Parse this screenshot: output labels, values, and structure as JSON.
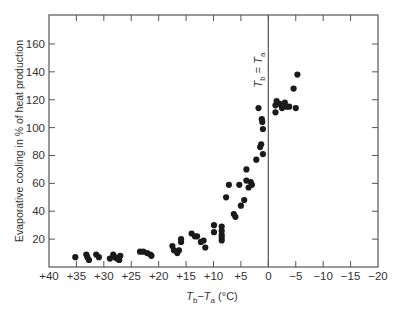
{
  "chart_data": {
    "type": "scatter",
    "title": "",
    "xlabel": "T_b − T_a (°C)",
    "xlabel_parts": {
      "t1": "T",
      "s1": "b",
      "minus": "−",
      "t2": "T",
      "s2": "a",
      "unit": " (°C)"
    },
    "ylabel": "Evaporative cooling in % of heat production",
    "xlim": [
      40,
      -20
    ],
    "ylim": [
      0,
      180
    ],
    "x_reversed": true,
    "x_ticks": [
      40,
      35,
      30,
      25,
      20,
      15,
      10,
      5,
      0,
      -5,
      -10,
      -15,
      -20
    ],
    "x_tick_labels": [
      "+40",
      "+35",
      "+30",
      "+25",
      "+20",
      "+15",
      "+10",
      "+5",
      "0",
      "−5",
      "−10",
      "−15",
      "−20"
    ],
    "y_ticks": [
      20,
      40,
      60,
      80,
      100,
      120,
      140,
      160
    ],
    "y_tick_labels": [
      "20",
      "40",
      "60",
      "80",
      "100",
      "120",
      "140",
      "160"
    ],
    "grid": false,
    "annotations": [
      {
        "text": "T_b = T_a",
        "parts": {
          "t1": "T",
          "s1": "b",
          "eq": " = ",
          "t2": "T",
          "s2": "a"
        },
        "x": 0,
        "type": "vertical-line"
      }
    ],
    "points": [
      [
        35.2,
        7
      ],
      [
        33.2,
        9
      ],
      [
        33.0,
        7
      ],
      [
        32.7,
        5
      ],
      [
        31.4,
        9
      ],
      [
        30.9,
        7
      ],
      [
        28.9,
        6
      ],
      [
        28.3,
        9
      ],
      [
        28.0,
        7
      ],
      [
        27.6,
        6
      ],
      [
        27.2,
        5
      ],
      [
        27.0,
        8
      ],
      [
        23.4,
        11
      ],
      [
        22.8,
        11
      ],
      [
        22.1,
        10
      ],
      [
        21.5,
        9
      ],
      [
        21.3,
        8
      ],
      [
        17.5,
        15
      ],
      [
        17.2,
        12
      ],
      [
        16.6,
        10
      ],
      [
        16.3,
        12
      ],
      [
        15.9,
        18
      ],
      [
        15.9,
        20
      ],
      [
        14.0,
        24
      ],
      [
        13.4,
        22
      ],
      [
        13.0,
        22
      ],
      [
        12.3,
        18
      ],
      [
        11.8,
        19
      ],
      [
        11.5,
        14
      ],
      [
        9.9,
        30
      ],
      [
        9.9,
        25
      ],
      [
        8.5,
        29
      ],
      [
        8.5,
        26
      ],
      [
        8.5,
        23
      ],
      [
        8.5,
        21
      ],
      [
        8.5,
        19
      ],
      [
        7.7,
        50
      ],
      [
        7.2,
        59
      ],
      [
        6.3,
        38
      ],
      [
        6.0,
        36
      ],
      [
        5.3,
        59
      ],
      [
        5.0,
        44
      ],
      [
        4.4,
        48
      ],
      [
        4.0,
        62
      ],
      [
        4.0,
        70
      ],
      [
        3.6,
        57
      ],
      [
        3.2,
        61
      ],
      [
        3.0,
        59
      ],
      [
        2.2,
        77
      ],
      [
        1.5,
        86
      ],
      [
        1.0,
        81
      ],
      [
        1.3,
        88
      ],
      [
        1.0,
        99
      ],
      [
        1.1,
        104
      ],
      [
        1.2,
        106
      ],
      [
        1.8,
        114
      ],
      [
        -1.3,
        111
      ],
      [
        -1.3,
        116
      ],
      [
        -1.5,
        119
      ],
      [
        -2.1,
        117
      ],
      [
        -2.5,
        114
      ],
      [
        -3.0,
        118
      ],
      [
        -3.3,
        115
      ],
      [
        -3.8,
        115
      ],
      [
        -4.6,
        128
      ],
      [
        -5.3,
        138
      ],
      [
        -5.0,
        114
      ]
    ]
  },
  "colors": {
    "axis": "#555555",
    "point": "#1a1a1a",
    "text": "#333333",
    "background": "#ffffff"
  }
}
